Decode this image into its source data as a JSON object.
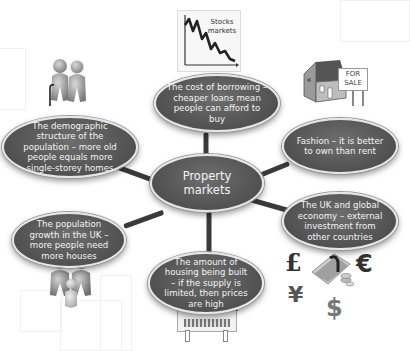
{
  "diagram": {
    "type": "mind-map",
    "center": {
      "label": "Property markets"
    },
    "nodes": [
      {
        "id": "borrowing",
        "label": "The cost of borrowing – cheaper loans mean people can afford to buy",
        "icon": "stock-chart-icon",
        "icon_label": "Stocks markets"
      },
      {
        "id": "demographic",
        "label": "The demographic structure of the population – more old people equals more single-storey homes",
        "icon": "elderly-couple-icon"
      },
      {
        "id": "fashion",
        "label": "Fashion – it is better to own than rent",
        "icon": "house-for-sale-icon",
        "icon_label": "FOR SALE"
      },
      {
        "id": "population",
        "label": "The population growth in the UK – more people need more houses",
        "icon": "family-icon"
      },
      {
        "id": "economy",
        "label": "The UK and global economy – external investment from other countries",
        "icon": "currency-money-icon",
        "currency_symbols": [
          "£",
          "€",
          "¥",
          "$"
        ]
      },
      {
        "id": "housing",
        "label": "The amount of housing being built – if the supply is limited, then prices are high",
        "icon": "new-development-sign-icon",
        "icon_label": "New Development"
      }
    ],
    "colors": {
      "node_fill": "#555555",
      "node_border": "#e6e6e6",
      "connector": "#3a3a3a",
      "text": "#f4f4f4"
    }
  }
}
